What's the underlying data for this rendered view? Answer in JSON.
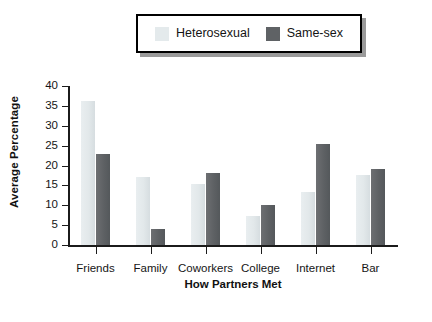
{
  "legend": {
    "entries": [
      {
        "label": "Heterosexual",
        "color": "#e4eaec",
        "key": "heterosexual"
      },
      {
        "label": "Same-sex",
        "color": "#5f6265",
        "key": "same_sex"
      }
    ]
  },
  "chart_data": {
    "type": "bar",
    "title": "",
    "xlabel": "How Partners Met",
    "ylabel": "Average Percentage",
    "categories": [
      "Friends",
      "Family",
      "Coworkers",
      "College",
      "Internet",
      "Bar"
    ],
    "series": [
      {
        "name": "Heterosexual",
        "color": "#e4eaec",
        "values": [
          36.3,
          17.1,
          15.3,
          7.4,
          13.3,
          17.6
        ]
      },
      {
        "name": "Same-sex",
        "color": "#5f6265",
        "values": [
          22.8,
          4.0,
          18.0,
          10.0,
          25.5,
          19.2
        ]
      }
    ],
    "ylim": [
      0,
      40
    ],
    "yticks": [
      0,
      5,
      10,
      15,
      20,
      25,
      30,
      35,
      40
    ],
    "ytick_labels": [
      "0",
      "5",
      "10",
      "15",
      "20",
      "25",
      "30",
      "35",
      "40"
    ],
    "grid": false,
    "legend_position": "top-center"
  }
}
